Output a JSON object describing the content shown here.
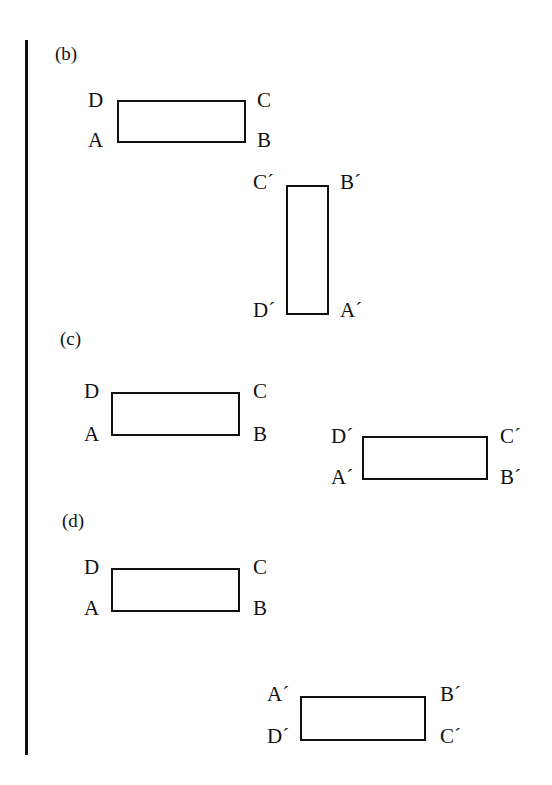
{
  "figure": {
    "sections": [
      {
        "label": "(b)"
      },
      {
        "label": "(c)"
      },
      {
        "label": "(d)"
      }
    ],
    "b": {
      "orig": {
        "D": "D",
        "C": "C",
        "A": "A",
        "B": "B"
      },
      "prime": {
        "C": "C´",
        "B": "B´",
        "D": "D´",
        "A": "A´"
      }
    },
    "c": {
      "orig": {
        "D": "D",
        "C": "C",
        "A": "A",
        "B": "B"
      },
      "prime": {
        "D": "D´",
        "C": "C´",
        "A": "A´",
        "B": "B´"
      }
    },
    "d": {
      "orig": {
        "D": "D",
        "C": "C",
        "A": "A",
        "B": "B"
      },
      "prime": {
        "A": "A´",
        "B": "B´",
        "D": "D´",
        "C": "C´"
      }
    }
  }
}
